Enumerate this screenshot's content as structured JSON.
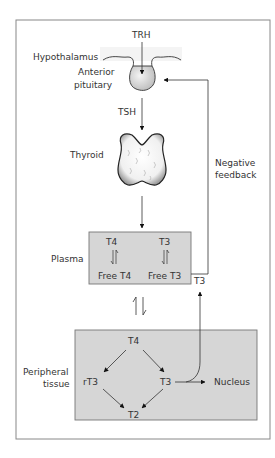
{
  "diagram": {
    "labels": {
      "trh": "TRH",
      "hypothalamus": "Hypothalamus",
      "anterior": "Anterior",
      "pituitary": "pituitary",
      "tsh": "TSH",
      "thyroid": "Thyroid",
      "negative": "Negative",
      "feedback": "feedback",
      "plasma": "Plasma",
      "plasma_t4": "T4",
      "plasma_t3": "T3",
      "free_t4": "Free T4",
      "free_t3": "Free T3",
      "t3_out": "T3",
      "peripheral": "Peripheral",
      "tissue": "tissue",
      "tissue_t4": "T4",
      "rt3": "rT3",
      "tissue_t3": "T3",
      "t2": "T2",
      "nucleus": "Nucleus"
    },
    "colors": {
      "box_fill": "#d6d6d6",
      "frame": "#777777",
      "arrow": "#222222"
    }
  }
}
